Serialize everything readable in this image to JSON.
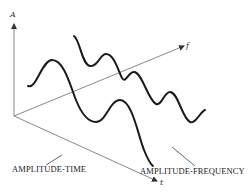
{
  "diagram": {
    "axes": {
      "amplitude": "A",
      "frequency": "f",
      "time": "t"
    },
    "captions": {
      "time_domain": "AMPLITUDE-TIME",
      "frequency_domain": "AMPLITUDE-FREQUENCY"
    },
    "colors": {
      "curve": "#1a1a1a",
      "axis": "#7a7a7a",
      "background": "#ffffff"
    }
  }
}
